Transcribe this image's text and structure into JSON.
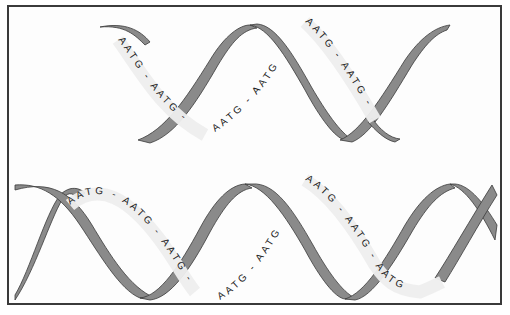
{
  "figure": {
    "colors": {
      "ribbon_fill": "#8a8a8a",
      "ribbon_stroke": "#3a3a3a",
      "label_band": "#eeeeee",
      "frame_border": "#3a3a3a"
    },
    "top_helix": {
      "labels": [
        {
          "text": "AATG - AATG -"
        },
        {
          "text": "AATG - AATG"
        },
        {
          "text": "AATG - AATG -"
        }
      ]
    },
    "bottom_helix": {
      "labels": [
        {
          "text": "AATG - AATG - AATG -"
        },
        {
          "text": "AATG - AATG"
        },
        {
          "text": "AATG - AATG - AATG"
        }
      ]
    }
  }
}
